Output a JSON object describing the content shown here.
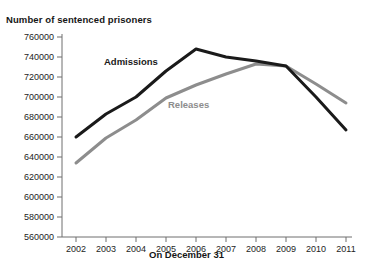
{
  "chart_data": {
    "type": "line",
    "title": "Number of sentenced prisoners",
    "xlabel": "On December 31",
    "ylabel": "",
    "x": [
      2002,
      2003,
      2004,
      2005,
      2006,
      2007,
      2008,
      2009,
      2010,
      2011
    ],
    "categories": [
      "2002",
      "2003",
      "2004",
      "2005",
      "2006",
      "2007",
      "2008",
      "2009",
      "2010",
      "2011"
    ],
    "ylim": [
      560000,
      760000
    ],
    "ytick_step": 20000,
    "ytick_labels": [
      "760000",
      "740000",
      "720000",
      "700000",
      "680000",
      "660000",
      "640000",
      "620000",
      "600000",
      "580000",
      "560000"
    ],
    "ytick_values": [
      760000,
      740000,
      720000,
      700000,
      680000,
      660000,
      640000,
      620000,
      600000,
      580000,
      560000
    ],
    "grid": false,
    "legend": "inline-annotations",
    "series": [
      {
        "name": "Admissions",
        "color": "#1a1a1a",
        "label_position": "inline-upper-left",
        "values": [
          660000,
          683000,
          700000,
          726000,
          748000,
          740000,
          736000,
          731000,
          700000,
          667000
        ]
      },
      {
        "name": "Releases",
        "color": "#8d8d8d",
        "label_position": "inline-lower-right",
        "values": [
          634000,
          659000,
          677000,
          699000,
          712000,
          723000,
          733000,
          731000,
          713000,
          694000
        ]
      }
    ],
    "annotations": [
      {
        "text": "Admissions",
        "series": "Admissions"
      },
      {
        "text": "Releases",
        "series": "Releases"
      }
    ]
  },
  "axis": {
    "axis_color": "#6e6e6e",
    "tick_color": "#6e6e6e"
  }
}
